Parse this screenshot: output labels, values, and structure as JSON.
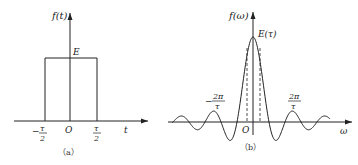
{
  "panel_a": {
    "y_label": "f(t)",
    "x_label": "t",
    "height_label": "E",
    "origin_label": "O",
    "left_tick": {
      "sign": "−",
      "num": "τ",
      "den": "2"
    },
    "right_tick": {
      "num": "τ",
      "den": "2"
    },
    "caption": "（a）"
  },
  "panel_b": {
    "y_label": "f(ω)",
    "x_label": "ω",
    "peak_label": "E(τ)",
    "origin_label": "O",
    "left_tick": {
      "sign": "−",
      "num": "2π",
      "den": "τ"
    },
    "right_tick": {
      "num": "2π",
      "den": "τ"
    },
    "caption": "（b）"
  }
}
